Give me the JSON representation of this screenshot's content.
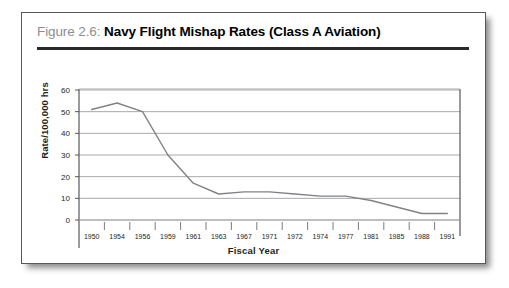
{
  "figure": {
    "number_label": "Figure 2.6:",
    "title": " Navy Flight Mishap Rates (Class A Aviation)"
  },
  "chart_data": {
    "type": "line",
    "title": "Navy Flight Mishap Rates (Class A Aviation)",
    "xlabel": "Fiscal Year",
    "ylabel": "Rate/100,000 hrs",
    "categories": [
      "1950",
      "1954",
      "1956",
      "1959",
      "1961",
      "1963",
      "1967",
      "1971",
      "1972",
      "1974",
      "1977",
      "1981",
      "1985",
      "1988",
      "1991"
    ],
    "values": [
      51,
      54,
      50,
      30,
      17,
      12,
      13,
      13,
      12,
      11,
      11,
      9,
      6,
      3,
      3
    ],
    "ylim": [
      0,
      60
    ],
    "yticks": [
      "0",
      "10",
      "20",
      "30",
      "40",
      "50",
      "60"
    ],
    "grid": true,
    "legend": false,
    "series_color": "#808285"
  },
  "colors": {
    "accent_rule": "#2a2a2c",
    "figure_number": "#8e8e90",
    "line": "#808285",
    "grid": "#a7a9ac",
    "axis": "#58585a"
  }
}
